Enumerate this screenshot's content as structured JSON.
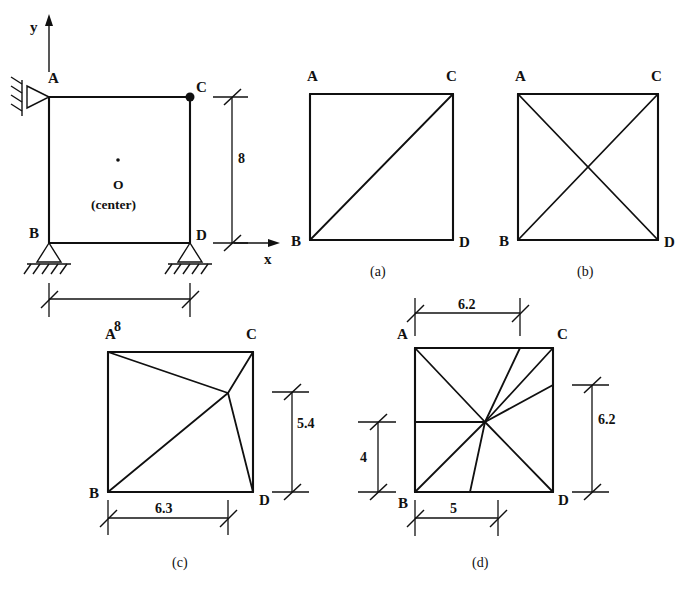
{
  "figure": {
    "title_visible": false,
    "background": "#ffffff",
    "ink": "#101010"
  },
  "main_frame": {
    "name": "portal-frame",
    "axes": {
      "y_label": "y",
      "x_label": "x"
    },
    "joints": {
      "A": "A",
      "B": "B",
      "C": "C",
      "D": "D"
    },
    "center_marker": {
      "label": "O",
      "sublabel": "(center)"
    },
    "supports": {
      "A": "pin-support-hatched",
      "B": "roller-support-ground",
      "D": "roller-support-ground"
    },
    "dimensions": [
      {
        "name": "frame-width",
        "value": "8",
        "orientation": "horizontal"
      },
      {
        "name": "frame-height",
        "value": "8",
        "orientation": "vertical"
      }
    ]
  },
  "panels": [
    {
      "id": "a",
      "caption": "(a)",
      "corner_labels": {
        "A": "A",
        "B": "B",
        "C": "C",
        "D": "D"
      },
      "bracing": "single-diagonal-B-to-C",
      "dimensions": []
    },
    {
      "id": "b",
      "caption": "(b)",
      "corner_labels": {
        "A": "A",
        "B": "B",
        "C": "C",
        "D": "D"
      },
      "bracing": "cross-diagonals-A-D-and-B-C",
      "dimensions": []
    },
    {
      "id": "c",
      "caption": "(c)",
      "corner_labels": {
        "A": "A",
        "B": "B",
        "C": "C",
        "D": "D"
      },
      "bracing": "interior-node-four-members-A-B-C-D",
      "dimensions": [
        {
          "name": "panel-c-width",
          "value": "6.3",
          "orientation": "horizontal"
        },
        {
          "name": "panel-c-height",
          "value": "5.4",
          "orientation": "vertical"
        }
      ]
    },
    {
      "id": "d",
      "caption": "(d)",
      "corner_labels": {
        "A": "A",
        "B": "B",
        "C": "C",
        "D": "D"
      },
      "bracing": "interior-node-eight-members",
      "dimensions": [
        {
          "name": "panel-d-top-width",
          "value": "6.2",
          "orientation": "horizontal"
        },
        {
          "name": "panel-d-right-height",
          "value": "6.2",
          "orientation": "vertical"
        },
        {
          "name": "panel-d-left-height",
          "value": "4",
          "orientation": "vertical"
        },
        {
          "name": "panel-d-bottom-width",
          "value": "5",
          "orientation": "horizontal"
        }
      ]
    }
  ]
}
